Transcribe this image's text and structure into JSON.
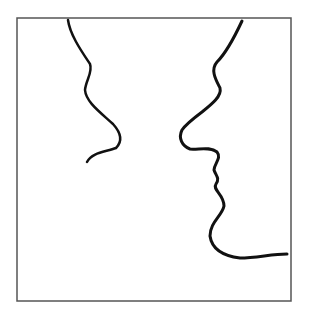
{
  "figure": {
    "frame": {
      "x": 17,
      "y": 18,
      "width": 274,
      "height": 283,
      "stroke": "#555555",
      "stroke_width": 1.5
    },
    "stroke_color": "#111111",
    "left_profile": {
      "path": "M68,20 C70,35 82,52 90,64 C93,72 86,80 85,90 C86,102 100,112 113,124 C122,134 122,142 116,148 C106,152 92,152 87,162",
      "stroke_width": 2.5
    },
    "right_profile": {
      "path": "M242,21 C235,36 227,52 217,62 C210,70 216,80 220,88 C222,96 212,104 202,112 C194,118 186,124 182,130 C178,138 182,146 190,149 C198,150 210,146 217,152 C222,158 214,164 214,170 C216,176 220,178 216,184 C212,190 224,194 224,206 C222,216 210,222 210,236 C212,250 224,256 240,258 C256,258 272,254 287,254",
      "stroke_width": 3
    }
  }
}
